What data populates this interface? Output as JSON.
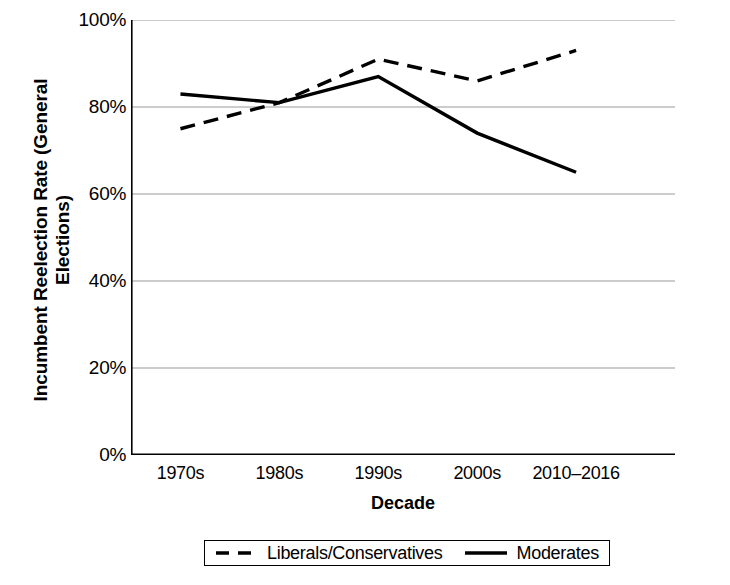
{
  "chart_data": {
    "type": "line",
    "title": "",
    "xlabel": "Decade",
    "ylabel": "Incumbent Reelection Rate (General Elections)",
    "ylabel_line1": "Incumbent Reelection Rate (General",
    "ylabel_line2": "Elections)",
    "categories": [
      "1970s",
      "1980s",
      "1990s",
      "2000s",
      "2010–2016"
    ],
    "ylim": [
      0,
      100
    ],
    "ytick_labels": [
      "100%",
      "80%",
      "60%",
      "40%",
      "20%",
      "0%"
    ],
    "ytick_values": [
      100,
      80,
      60,
      40,
      20,
      0
    ],
    "grid": true,
    "grid_axis": "y",
    "legend_position": "bottom",
    "series": [
      {
        "name": "Liberals/Conservatives",
        "style": "dashed",
        "color": "#000000",
        "values": [
          75,
          81,
          91,
          86,
          93
        ]
      },
      {
        "name": "Moderates",
        "style": "solid",
        "color": "#000000",
        "values": [
          83,
          81,
          87,
          74,
          65
        ]
      }
    ]
  },
  "legend": {
    "items": [
      {
        "label": "Liberals/Conservatives",
        "style": "dashed"
      },
      {
        "label": "Moderates",
        "style": "solid"
      }
    ]
  },
  "colors": {
    "line": "#000000",
    "grid": "#9a9a9a",
    "axis": "#000000",
    "background": "#ffffff"
  }
}
